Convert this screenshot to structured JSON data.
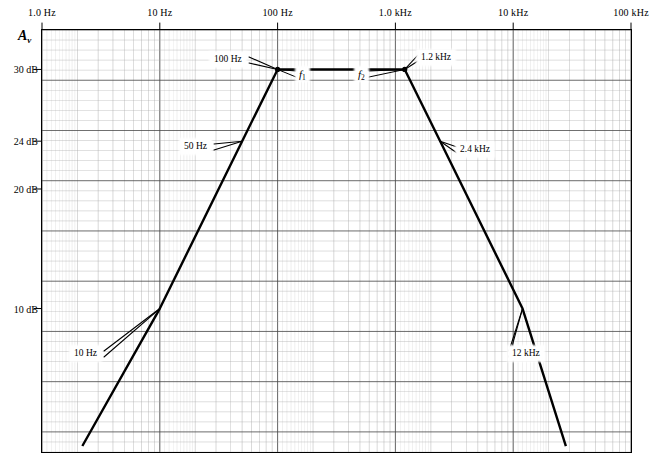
{
  "figure": {
    "y_axis_title": "A",
    "y_axis_title_sub": "v",
    "plot_left": 42,
    "plot_right": 631,
    "plot_top": 30,
    "plot_bottom": 452
  },
  "chart_data": {
    "type": "line",
    "title": "",
    "xlabel": "",
    "ylabel": "Av",
    "x_scale": "log",
    "x_unit": "Hz",
    "y_unit": "dB",
    "xlim": [
      1,
      100000
    ],
    "ylim": [
      -2,
      33.3
    ],
    "grid": true,
    "legend": null,
    "x_ticks": [
      {
        "label": "1.0 Hz",
        "value": 1
      },
      {
        "label": "10 Hz",
        "value": 10
      },
      {
        "label": "100 Hz",
        "value": 100
      },
      {
        "label": "1.0 kHz",
        "value": 1000
      },
      {
        "label": "10 kHz",
        "value": 10000
      },
      {
        "label": "100 kHz",
        "value": 100000
      }
    ],
    "y_ticks": [
      {
        "label": "30 dB",
        "value": 30
      },
      {
        "label": "24 dB",
        "value": 24
      },
      {
        "label": "20 dB",
        "value": 20
      },
      {
        "label": "10 dB",
        "value": 10
      }
    ],
    "series": [
      {
        "name": "Av",
        "points": [
          {
            "x": 2.2,
            "y": -1.5
          },
          {
            "x": 10,
            "y": 10
          },
          {
            "x": 50,
            "y": 24
          },
          {
            "x": 100,
            "y": 30
          },
          {
            "x": 1200,
            "y": 30
          },
          {
            "x": 2400,
            "y": 24
          },
          {
            "x": 12000,
            "y": 10
          },
          {
            "x": 28000,
            "y": -1.5
          }
        ]
      }
    ],
    "annotations": [
      {
        "name": "f1-corner",
        "text": "100 Hz",
        "x": 100,
        "y": 30
      },
      {
        "name": "f2-corner",
        "text": "1.2 kHz",
        "x": 1200,
        "y": 30
      },
      {
        "name": "lower-midband",
        "text": "50 Hz",
        "x": 50,
        "y": 24
      },
      {
        "name": "upper-midband",
        "text": "2.4 kHz",
        "x": 2400,
        "y": 24
      },
      {
        "name": "low-rolloff",
        "text": "10 Hz",
        "x": 10,
        "y": 10
      },
      {
        "name": "high-rolloff",
        "text": "12 kHz",
        "x": 12000,
        "y": 10
      },
      {
        "name": "f1-symbol",
        "text": "f",
        "sub": "1",
        "x": 178,
        "y": 26.5
      },
      {
        "name": "f2-symbol",
        "text": "f",
        "sub": "2",
        "x": 660,
        "y": 26.5
      }
    ]
  },
  "colors": {
    "curve": "#000000",
    "grid_minor": "#a8a8a8",
    "grid_major": "#4a4a4a",
    "axis": "#000000",
    "background": "#ffffff"
  }
}
